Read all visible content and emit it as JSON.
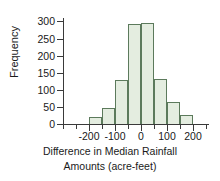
{
  "chart_data": {
    "type": "bar",
    "title": "",
    "xlabel": "Difference in Median Rainfall Amounts (acre-feet)",
    "xlabel_line1": "Difference in Median Rainfall",
    "xlabel_line2": "Amounts (acre-feet)",
    "ylabel": "Frequency",
    "ylim": [
      0,
      310
    ],
    "xlim": [
      -300,
      260
    ],
    "grid": false,
    "legend": null,
    "bin_width": 50,
    "bin_edges": [
      -300,
      -250,
      -200,
      -150,
      -100,
      -50,
      0,
      50,
      100,
      150,
      200,
      250
    ],
    "categories": [
      "-300 to -250",
      "-250 to -200",
      "-200 to -150",
      "-150 to -100",
      "-100 to -50",
      "-50 to 0",
      "0 to 50",
      "50 to 100",
      "100 to 150",
      "150 to 200",
      "200 to 250"
    ],
    "values": [
      3,
      3,
      20,
      47,
      130,
      292,
      295,
      132,
      64,
      27,
      3
    ],
    "y_ticks": [
      0,
      50,
      100,
      150,
      200,
      250,
      300
    ],
    "y_tick_labels": [
      "0",
      "50",
      "100",
      "150",
      "200",
      "250",
      "300"
    ],
    "x_ticks": [
      -200,
      -100,
      0,
      100,
      200
    ],
    "x_tick_labels": [
      "-200",
      "-100",
      "0",
      "100",
      "200"
    ],
    "bar_fill_color": "#e4ede0",
    "bar_edge_color": "#5c7a5c",
    "axis_color": "#3a3a3a",
    "text_color": "#1a1a1a",
    "background_color": "#ffffff"
  }
}
